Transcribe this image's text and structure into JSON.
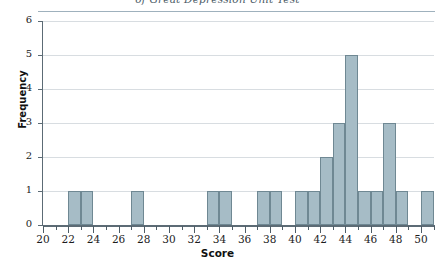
{
  "chart_data": {
    "type": "bar",
    "title": "of Great Depression Unit Test",
    "xlabel": "Score",
    "ylabel": "Frequency",
    "xlim": [
      20,
      51
    ],
    "ylim": [
      0,
      6
    ],
    "grid": true,
    "legend": "none",
    "bar_color": "#a6bcc6",
    "bar_edge_color": "#6f8893",
    "axis_color": "#5c6b75",
    "x_tick_labels": [
      "20",
      "22",
      "24",
      "26",
      "28",
      "30",
      "32",
      "34",
      "36",
      "38",
      "40",
      "42",
      "44",
      "46",
      "48",
      "50"
    ],
    "x_tick_values": [
      20,
      22,
      24,
      26,
      28,
      30,
      32,
      34,
      36,
      38,
      40,
      42,
      44,
      46,
      48,
      50
    ],
    "x_minor_tick_values": [
      21,
      23,
      25,
      27,
      29,
      31,
      33,
      35,
      37,
      39,
      41,
      43,
      45,
      47,
      49,
      51
    ],
    "y_tick_labels": [
      "0",
      "1",
      "2",
      "3",
      "4",
      "5",
      "6"
    ],
    "y_tick_values": [
      0,
      1,
      2,
      3,
      4,
      5,
      6
    ],
    "bin_width": 1,
    "categories": [
      22,
      23,
      27,
      33,
      34,
      37,
      38,
      40,
      41,
      42,
      43,
      44,
      45,
      46,
      47,
      48,
      50
    ],
    "values": [
      1,
      1,
      1,
      1,
      1,
      1,
      1,
      1,
      1,
      2,
      3,
      5,
      1,
      1,
      3,
      1,
      1
    ],
    "bars": [
      {
        "score": 22,
        "frequency": 1
      },
      {
        "score": 23,
        "frequency": 1
      },
      {
        "score": 27,
        "frequency": 1
      },
      {
        "score": 33,
        "frequency": 1
      },
      {
        "score": 34,
        "frequency": 1
      },
      {
        "score": 37,
        "frequency": 1
      },
      {
        "score": 38,
        "frequency": 1
      },
      {
        "score": 40,
        "frequency": 1
      },
      {
        "score": 41,
        "frequency": 1
      },
      {
        "score": 42,
        "frequency": 2
      },
      {
        "score": 43,
        "frequency": 3
      },
      {
        "score": 44,
        "frequency": 5
      },
      {
        "score": 45,
        "frequency": 1
      },
      {
        "score": 46,
        "frequency": 1
      },
      {
        "score": 47,
        "frequency": 3
      },
      {
        "score": 48,
        "frequency": 1
      },
      {
        "score": 50,
        "frequency": 1
      }
    ]
  }
}
